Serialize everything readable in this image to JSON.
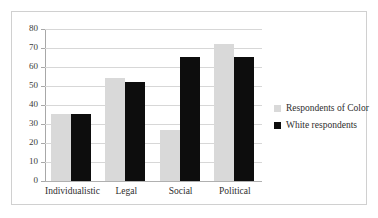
{
  "chart_data": {
    "type": "bar",
    "title": "",
    "subtitle": "",
    "xlabel": "",
    "ylabel": "",
    "categories": [
      "Individualistic",
      "Legal",
      "Social",
      "Political"
    ],
    "series": [
      {
        "name": "Respondents of Color",
        "color": "#D9D9D9",
        "values": [
          35,
          54,
          27,
          72
        ]
      },
      {
        "name": "White respondents",
        "color": "#0D0D0D",
        "values": [
          35,
          52,
          65,
          65
        ]
      }
    ],
    "ylim": [
      0,
      80
    ],
    "ytick_values": [
      0,
      10,
      20,
      30,
      40,
      50,
      60,
      70,
      80
    ],
    "ytick_labels": [
      "0",
      "10",
      "20",
      "30",
      "40",
      "50",
      "60",
      "70",
      "80"
    ],
    "grid": true,
    "grid_axis": "y",
    "legend_position": "right",
    "legend_entries": [
      "Respondents of Color",
      "White respondents"
    ]
  },
  "figure": {
    "border_color": "#D0D0D0",
    "background": "#FFFFFF"
  }
}
